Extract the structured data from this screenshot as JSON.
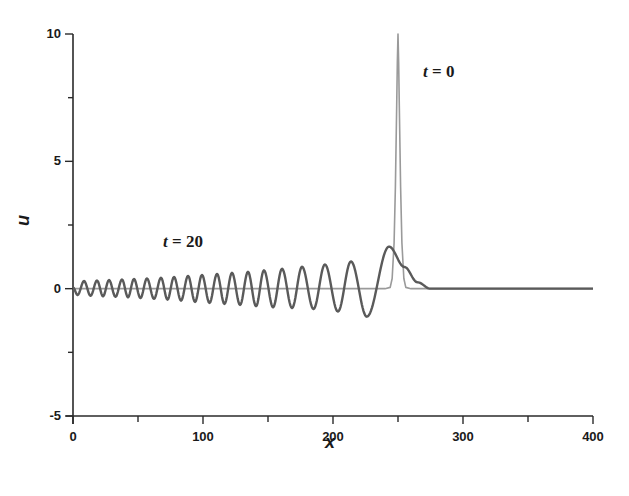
{
  "chart_data": {
    "type": "line",
    "title": "",
    "xlabel": "x",
    "ylabel": "u",
    "xlim": [
      0,
      400
    ],
    "ylim": [
      -5,
      10
    ],
    "grid": false,
    "legend": null,
    "x_ticks": [
      0,
      100,
      200,
      300,
      400
    ],
    "x_tick_labels": [
      "0",
      "100",
      "200",
      "300",
      "400"
    ],
    "x_minor_ticks": [
      50,
      150,
      250,
      350
    ],
    "y_ticks": [
      -5,
      0,
      5,
      10
    ],
    "y_tick_labels": [
      "-5",
      "0",
      "5",
      "10"
    ],
    "y_minor_ticks": [
      -2.5,
      2.5,
      7.5
    ],
    "annotations": [
      {
        "text_var": "t",
        "text_eq": " = 0",
        "x": 268,
        "y": 8.7,
        "refers_to": "t = 0"
      },
      {
        "text_var": "t",
        "text_eq": " = 20",
        "x": 70,
        "y": 1.9,
        "refers_to": "t = 20"
      }
    ],
    "series": [
      {
        "name": "t = 0",
        "color": "#9a9a9a",
        "stroke_width": 1.6,
        "description": "Narrow soliton-like pulse centered at x = 250, peak u = 10, zero elsewhere",
        "x": [
          0,
          240,
          244,
          245.5,
          247,
          248,
          249,
          249.5,
          250,
          250.5,
          251,
          252,
          253,
          254.5,
          256,
          260,
          400
        ],
        "values": [
          0,
          0,
          0.05,
          0.4,
          1.8,
          4.0,
          7.2,
          8.9,
          10,
          8.9,
          7.2,
          4.0,
          1.8,
          0.4,
          0.05,
          0,
          0
        ]
      },
      {
        "name": "t = 20",
        "color": "#5a5a5a",
        "stroke_width": 2.4,
        "description": "Dispersive oscillatory wave train with growing amplitude towards a leading hump at x ≈ 243, then decaying to zero by x ≈ 275",
        "extrema_x": [
          0,
          3.5,
          8.5,
          13.5,
          18.5,
          23.1,
          27.7,
          32.7,
          37.7,
          42.3,
          46.9,
          51.9,
          56.9,
          62.3,
          67.7,
          72.7,
          77.7,
          83.1,
          88.5,
          93.9,
          99.2,
          105,
          110.8,
          116.5,
          122.3,
          128.5,
          134.6,
          140.8,
          146.9,
          153.9,
          160.8,
          168.5,
          176.2,
          185,
          193.8,
          203.8,
          213.8,
          226,
          243.1,
          255,
          265,
          275,
          400
        ],
        "extrema_u": [
          0.05,
          -0.25,
          0.3,
          -0.28,
          0.32,
          -0.3,
          0.34,
          -0.32,
          0.36,
          -0.34,
          0.38,
          -0.37,
          0.4,
          -0.4,
          0.43,
          -0.43,
          0.46,
          -0.47,
          0.5,
          -0.52,
          0.54,
          -0.56,
          0.58,
          -0.6,
          0.62,
          -0.64,
          0.66,
          -0.69,
          0.72,
          -0.73,
          0.78,
          -0.76,
          0.86,
          -0.8,
          0.95,
          -0.9,
          1.07,
          -1.1,
          1.65,
          0.85,
          0.25,
          0.0,
          0.0
        ]
      }
    ]
  }
}
